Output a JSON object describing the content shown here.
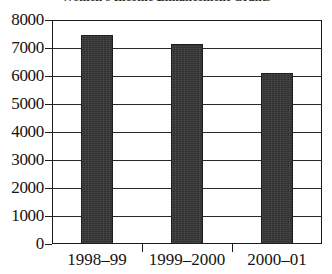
{
  "chart_data": {
    "type": "bar",
    "title": "Women's Income Enhancement Grants",
    "xlabel": "",
    "ylabel": "",
    "categories": [
      "1998–99",
      "1999–2000",
      "2000–01"
    ],
    "values": [
      7450,
      7150,
      6100
    ],
    "ylim": [
      0,
      8000
    ],
    "ytick_labels": [
      "8000",
      "7000",
      "6000",
      "5000",
      "4000",
      "3000",
      "2000",
      "1000",
      "0"
    ],
    "ytick_values": [
      8000,
      7000,
      6000,
      5000,
      4000,
      3000,
      2000,
      1000,
      0
    ],
    "grid": "horizontal",
    "legend": "none",
    "bar_color": "#303030",
    "frame_color": "#1a1a1a",
    "background_color": "#ffffff"
  }
}
